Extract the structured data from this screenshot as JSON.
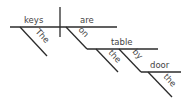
{
  "diagram": {
    "type": "sentence-diagram",
    "sentence": "The keys are on the table by the door",
    "subject": "keys",
    "subject_modifier": "The",
    "verb": "are",
    "preposition_1": "on",
    "object_1": "table",
    "object_1_modifier": "the",
    "preposition_2": "by",
    "object_2": "door",
    "object_2_modifier": "the",
    "line_color": "#2b2b2b",
    "text_color": "#444444"
  }
}
